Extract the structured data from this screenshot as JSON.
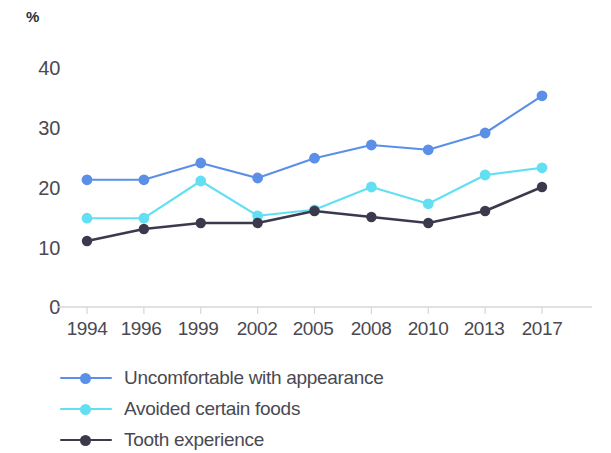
{
  "chart_data": {
    "type": "line",
    "title": "",
    "subtitle": "",
    "xlabel": "",
    "ylabel": "%",
    "unit_label": "%",
    "categories": [
      "1994",
      "1996",
      "1999",
      "2002",
      "2005",
      "2008",
      "2010",
      "2013",
      "2017"
    ],
    "x": [
      1994,
      1996,
      1999,
      2002,
      2005,
      2008,
      2010,
      2013,
      2017
    ],
    "ylim": [
      0,
      44
    ],
    "yticks": [
      0,
      10,
      20,
      30,
      40
    ],
    "ytick_labels": [
      "0",
      "10",
      "20",
      "30",
      "40"
    ],
    "grid": false,
    "legend_position": "bottom-left",
    "series": [
      {
        "name": "Uncomfortable with appearance",
        "color": "#5b8fe8",
        "marker": "circle",
        "values": [
          21.2,
          21.2,
          24.0,
          21.5,
          24.8,
          27.0,
          26.2,
          29.0,
          35.2
        ]
      },
      {
        "name": "Avoided certain foods",
        "color": "#62dff2",
        "marker": "circle",
        "values": [
          14.8,
          14.8,
          21.0,
          15.2,
          16.2,
          20.0,
          17.2,
          22.0,
          23.2
        ]
      },
      {
        "name": "Tooth experience",
        "color": "#3b3a4d",
        "marker": "circle",
        "values": [
          11.0,
          13.0,
          14.0,
          14.0,
          16.0,
          15.0,
          14.0,
          16.0,
          20.0
        ]
      }
    ]
  },
  "axes": {
    "unit_label": "%",
    "y_tick_labels": [
      "40",
      "30",
      "20",
      "10",
      "0"
    ],
    "x_tick_labels": [
      "1994",
      "1996",
      "1999",
      "2002",
      "2005",
      "2008",
      "2010",
      "2013",
      "2017"
    ]
  },
  "legend": {
    "items": [
      {
        "label": "Uncomfortable with appearance",
        "color": "#5b8fe8"
      },
      {
        "label": "Avoided certain foods",
        "color": "#62dff2"
      },
      {
        "label": "Tooth experience",
        "color": "#3b3a4d"
      }
    ]
  }
}
